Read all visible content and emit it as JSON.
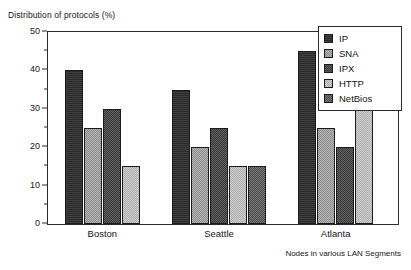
{
  "chart_data": {
    "type": "bar",
    "title": "Distribution of protocols (%)",
    "xlabel": "Nodes in various LAN Segments",
    "ylabel": "",
    "ylim": [
      0,
      50
    ],
    "ytick_values": [
      0,
      10,
      20,
      30,
      40,
      50
    ],
    "ytick_labels": [
      "0",
      "10",
      "20",
      "30",
      "40",
      "50"
    ],
    "yminor_step": 5,
    "grid": false,
    "legend_position": "top-right",
    "categories": [
      "Boston",
      "Seattle",
      "Atlanta"
    ],
    "series": [
      {
        "name": "IP",
        "color": "#2a2a2a",
        "values": [
          40,
          35,
          45
        ]
      },
      {
        "name": "SNA",
        "color": "#9a9a9a",
        "values": [
          25,
          20,
          25
        ]
      },
      {
        "name": "IPX",
        "color": "#4a4a4a",
        "values": [
          30,
          25,
          20
        ]
      },
      {
        "name": "HTTP",
        "color": "#b9b9b9",
        "values": [
          15,
          15,
          30
        ]
      },
      {
        "name": "NetBios",
        "color": "#5f5f5f",
        "values": [
          null,
          15,
          null
        ]
      }
    ]
  },
  "legend": {
    "items": [
      {
        "label": "IP",
        "swatch": "legend-swatch-ip"
      },
      {
        "label": "SNA",
        "swatch": "legend-swatch-sna"
      },
      {
        "label": "IPX",
        "swatch": "legend-swatch-ipx"
      },
      {
        "label": "HTTP",
        "swatch": "legend-swatch-http"
      },
      {
        "label": "NetBios",
        "swatch": "legend-swatch-netbios"
      }
    ]
  }
}
